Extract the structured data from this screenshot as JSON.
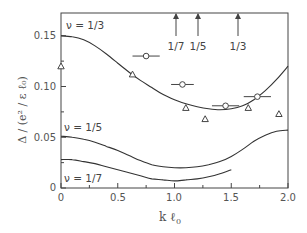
{
  "chart_data": {
    "type": "line",
    "title": "",
    "xlabel": "k ℓ₀",
    "ylabel": "Δ / (e² / ε ℓ₀)",
    "xlim": [
      0,
      2.0
    ],
    "ylim": [
      0,
      0.172
    ],
    "grid": false,
    "x_ticks": [
      0,
      0.5,
      1.0,
      1.5,
      2.0
    ],
    "x_tick_labels": [
      "0",
      "0.5",
      "1.0",
      "1.5",
      "2.0"
    ],
    "x_minor_ticks": [
      0.25,
      0.75,
      1.25,
      1.75
    ],
    "y_ticks": [
      0,
      0.05,
      0.1,
      0.15
    ],
    "y_tick_labels": [
      "0",
      "0.05",
      "0.10",
      "0.15"
    ],
    "y_minor_ticks": [
      0.025,
      0.075,
      0.125
    ],
    "series": [
      {
        "name": "ν = 1/3",
        "kind": "curve",
        "x": [
          0,
          0.1,
          0.2,
          0.3,
          0.4,
          0.5,
          0.6,
          0.7,
          0.8,
          0.9,
          1.0,
          1.1,
          1.2,
          1.3,
          1.4,
          1.5,
          1.6,
          1.7,
          1.8,
          1.9,
          2.0
        ],
        "y": [
          0.15,
          0.149,
          0.146,
          0.14,
          0.132,
          0.123,
          0.114,
          0.106,
          0.099,
          0.092,
          0.087,
          0.083,
          0.08,
          0.078,
          0.077,
          0.078,
          0.081,
          0.087,
          0.096,
          0.107,
          0.12
        ]
      },
      {
        "name": "ν = 1/5",
        "kind": "curve",
        "x": [
          0,
          0.1,
          0.2,
          0.3,
          0.4,
          0.5,
          0.6,
          0.7,
          0.8,
          0.9,
          1.0,
          1.1,
          1.2,
          1.3,
          1.4,
          1.5,
          1.6,
          1.7,
          1.8,
          1.9,
          2.0
        ],
        "y": [
          0.051,
          0.05,
          0.048,
          0.045,
          0.041,
          0.037,
          0.032,
          0.027,
          0.023,
          0.021,
          0.02,
          0.02,
          0.021,
          0.023,
          0.026,
          0.031,
          0.038,
          0.046,
          0.052,
          0.056,
          0.057
        ]
      },
      {
        "name": "ν = 1/7",
        "kind": "curve",
        "x": [
          0,
          0.1,
          0.2,
          0.3,
          0.4,
          0.5,
          0.6,
          0.7,
          0.8,
          0.9,
          1.0,
          1.1,
          1.2,
          1.3,
          1.4,
          1.5
        ],
        "y": [
          0.028,
          0.028,
          0.026,
          0.024,
          0.021,
          0.018,
          0.015,
          0.012,
          0.009,
          0.008,
          0.007,
          0.008,
          0.009,
          0.011,
          0.014,
          0.018
        ]
      },
      {
        "name": "circles (with horizontal error bars)",
        "kind": "scatter",
        "marker": "circle",
        "x": [
          0.75,
          1.07,
          1.45,
          1.73
        ],
        "y": [
          0.13,
          0.102,
          0.081,
          0.09
        ],
        "xerr": [
          0.12,
          0.1,
          0.12,
          0.12
        ]
      },
      {
        "name": "triangles",
        "kind": "scatter",
        "marker": "triangle",
        "x": [
          0.0,
          0.63,
          1.1,
          1.27,
          1.65,
          1.92
        ],
        "y": [
          0.12,
          0.112,
          0.079,
          0.068,
          0.079,
          0.073
        ]
      }
    ],
    "annotations": [
      {
        "text": "ν = 1/3",
        "x": 0.07,
        "y": 0.16
      },
      {
        "text": "ν = 1/5",
        "x": 0.03,
        "y": 0.058
      },
      {
        "text": "ν = 1/7",
        "x": 0.03,
        "y": 0.01
      },
      {
        "text": "1/7",
        "x": 1.01,
        "kind": "arrow-up"
      },
      {
        "text": "1/5",
        "x": 1.21,
        "kind": "arrow-up"
      },
      {
        "text": "1/3",
        "x": 1.56,
        "kind": "arrow-up"
      }
    ]
  },
  "labels": {
    "xlabel_main": "k ℓ",
    "xlabel_sub": "0",
    "ylabel": "Δ / (e² / ε ℓ₀)",
    "nu13": "ν = 1/3",
    "nu15": "ν = 1/5",
    "nu17": "ν = 1/7",
    "arrow17": "1/7",
    "arrow15": "1/5",
    "arrow13": "1/3",
    "xt0": "0",
    "xt1": "0.5",
    "xt2": "1.0",
    "xt3": "1.5",
    "xt4": "2.0",
    "yt0": "0",
    "yt1": "0.05",
    "yt2": "0.10",
    "yt3": "0.15"
  }
}
